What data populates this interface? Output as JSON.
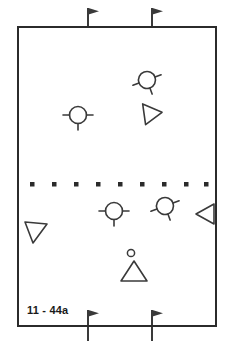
{
  "diagram": {
    "label": "11 - 44a",
    "title": "11 - 44a",
    "colors": {
      "line": "#3a3a3a",
      "border": "#2b2b2b",
      "background": "#ffffff",
      "text": "#1a1a1a"
    },
    "field": {
      "x": 17,
      "y": 26,
      "width": 200,
      "height": 301,
      "border_width": 2
    },
    "halfway_line": {
      "type": "dotted",
      "y": 184,
      "dot_count": 9,
      "dot_size": 4,
      "x_start": 26,
      "x_end": 208
    },
    "flags": [
      {
        "name": "flag-top-left",
        "x": 88,
        "y_top": 8,
        "y_bottom": 26,
        "pennant": "right"
      },
      {
        "name": "flag-top-right",
        "x": 152,
        "y_top": 8,
        "y_bottom": 26,
        "pennant": "right"
      },
      {
        "name": "flag-bottom-left",
        "x": 88,
        "y_top": 310,
        "y_bottom": 340,
        "pennant": "right"
      },
      {
        "name": "flag-bottom-right",
        "x": 152,
        "y_top": 310,
        "y_bottom": 340,
        "pennant": "right"
      }
    ],
    "players": [
      {
        "name": "player-marker-upper-right",
        "x": 147,
        "y": 80,
        "r": 9,
        "rotation": -20
      },
      {
        "name": "player-marker-upper-left",
        "x": 78,
        "y": 115,
        "r": 9,
        "rotation": 0
      },
      {
        "name": "player-marker-lower-left",
        "x": 114,
        "y": 211,
        "r": 9,
        "rotation": 0
      },
      {
        "name": "player-marker-lower-right",
        "x": 165,
        "y": 206,
        "r": 9,
        "rotation": -20
      }
    ],
    "cones": [
      {
        "name": "cone-upper-right",
        "x": 144,
        "y": 113,
        "size": 11,
        "direction": "right"
      },
      {
        "name": "cone-left",
        "x": 35,
        "y": 231,
        "size": 11,
        "direction": "left-down"
      },
      {
        "name": "cone-right",
        "x": 205,
        "y": 214,
        "size": 11,
        "direction": "left"
      },
      {
        "name": "cone-bottom-center",
        "x": 134,
        "y": 271,
        "size": 11,
        "direction": "up"
      }
    ],
    "ball": {
      "name": "ball-marker",
      "x": 131,
      "y": 253,
      "r": 3.5
    }
  }
}
